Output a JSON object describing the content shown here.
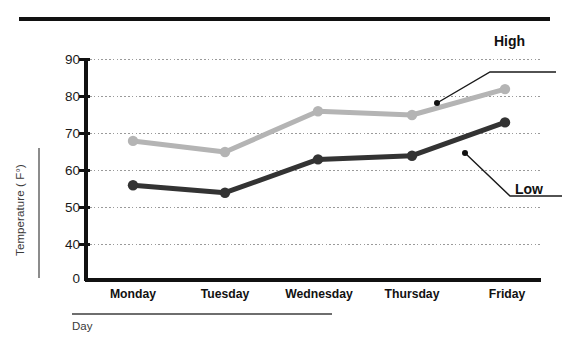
{
  "chart_data": {
    "type": "line",
    "title": "",
    "xlabel": "Day",
    "ylabel": "Temperature ( F°)",
    "categories": [
      "Monday",
      "Tuesday",
      "Wednesday",
      "Thursday",
      "Friday"
    ],
    "series": [
      {
        "name": "High",
        "color": "#b4b4b4",
        "values": [
          68,
          65,
          76,
          75,
          82
        ]
      },
      {
        "name": "Low",
        "color": "#333333",
        "values": [
          56,
          54,
          63,
          64,
          73
        ]
      }
    ],
    "ylim": [
      0,
      90
    ],
    "yticks": [
      "0",
      "40",
      "50",
      "60",
      "70",
      "80",
      "90"
    ],
    "axis_break": true,
    "grid": "horizontal-dotted",
    "legend_position": "inline-annotations",
    "annotations": [
      {
        "label": "High",
        "points_to_series": "High"
      },
      {
        "label": "Low",
        "points_to_series": "Low"
      }
    ]
  },
  "axes": {
    "y_title": "Temperature ( F°)",
    "x_title": "Day",
    "y_labels": {
      "t90": "90",
      "t80": "80",
      "t70": "70",
      "t60": "60",
      "t50": "50",
      "t40": "40",
      "t0": "0"
    },
    "x_labels": {
      "d0": "Monday",
      "d1": "Tuesday",
      "d2": "Wednesday",
      "d3": "Thursday",
      "d4": "Friday"
    }
  },
  "annotations": {
    "high": "High",
    "low": "Low"
  },
  "colors": {
    "high_series": "#b4b4b4",
    "low_series": "#333333",
    "axis": "#111111",
    "grid": "#9a9a9a",
    "label": "#3a3a3a"
  }
}
